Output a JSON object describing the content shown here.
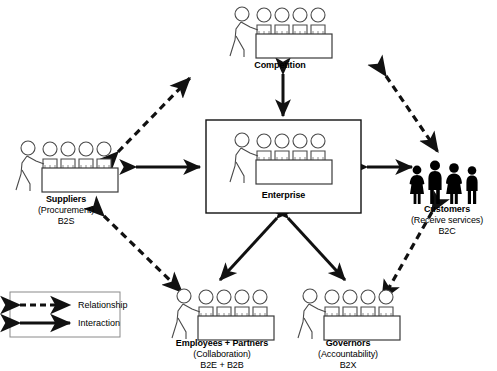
{
  "diagram": {
    "title_visible": false,
    "background": "#ffffff",
    "stroke": "#111111",
    "nodes": [
      {
        "id": "competition",
        "name": "Competition",
        "title": "Competition",
        "subtitle": "",
        "code": "",
        "figure": "group-at-counter",
        "x": 228,
        "y": 6,
        "w": 104,
        "h": 52
      },
      {
        "id": "enterprise",
        "name": "Enterprise",
        "title": "Enterprise",
        "subtitle": "",
        "code": "",
        "figure": "group-at-counter-boxed",
        "x": 206,
        "y": 120,
        "w": 155,
        "h": 93
      },
      {
        "id": "suppliers",
        "name": "Suppliers",
        "title": "Suppliers",
        "subtitle": "(Procurement)",
        "code": "B2S",
        "figure": "group-at-counter",
        "x": 14,
        "y": 140,
        "w": 104,
        "h": 52
      },
      {
        "id": "customers",
        "name": "Customers",
        "title": "Customers",
        "subtitle": "(Receive services)",
        "code": "B2C",
        "figure": "family-silhouette",
        "x": 408,
        "y": 160,
        "w": 78,
        "h": 46
      },
      {
        "id": "employees",
        "name": "Employees + Partners",
        "title": "Employees + Partners",
        "subtitle": "(Collaboration)",
        "code": "B2E + B2B",
        "figure": "group-at-counter",
        "x": 170,
        "y": 288,
        "w": 104,
        "h": 52
      },
      {
        "id": "governors",
        "name": "Governors",
        "title": "Governors",
        "subtitle": "(Accountability)",
        "code": "B2X",
        "figure": "group-at-counter",
        "x": 296,
        "y": 288,
        "w": 104,
        "h": 52
      }
    ],
    "edges": [
      {
        "from": "enterprise",
        "to": "competition",
        "type": "interaction",
        "style": "solid"
      },
      {
        "from": "enterprise",
        "to": "suppliers",
        "type": "interaction",
        "style": "solid"
      },
      {
        "from": "enterprise",
        "to": "customers",
        "type": "interaction",
        "style": "solid"
      },
      {
        "from": "enterprise",
        "to": "employees",
        "type": "interaction",
        "style": "solid"
      },
      {
        "from": "enterprise",
        "to": "governors",
        "type": "interaction",
        "style": "solid"
      },
      {
        "from": "suppliers",
        "to": "competition",
        "type": "relationship",
        "style": "dashed"
      },
      {
        "from": "competition",
        "to": "customers",
        "type": "relationship",
        "style": "dashed"
      },
      {
        "from": "suppliers",
        "to": "employees",
        "type": "relationship",
        "style": "dashed"
      },
      {
        "from": "customers",
        "to": "governors",
        "type": "relationship",
        "style": "dashed"
      }
    ]
  },
  "legend": {
    "items": [
      {
        "label": "Relationship",
        "style": "dashed"
      },
      {
        "label": "Interaction",
        "style": "solid"
      }
    ],
    "border_color": "#8a8a8a"
  }
}
